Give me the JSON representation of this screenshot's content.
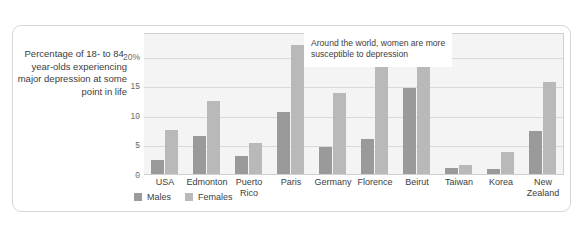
{
  "caption": "Percentage of 18- to 84-year-olds experiencing major depression at some point in life",
  "annotation": "Around the world, women are more susceptible to depression",
  "legend": {
    "males_label": "Males",
    "females_label": "Females"
  },
  "colors": {
    "males": "#9a9a9a",
    "females": "#b9b9b9",
    "plot_background": "#f4f4f4",
    "gridline": "#d9d9d9",
    "frame_border": "#d6d6d6"
  },
  "chart_data": {
    "type": "bar",
    "title": "",
    "xlabel": "",
    "ylabel": "Percentage of 18- to 84-year-olds experiencing major depression at some point in life",
    "ylim": [
      0,
      24
    ],
    "yticks": [
      0,
      5,
      10,
      15,
      20
    ],
    "ytick_labels": [
      "0",
      "5",
      "10",
      "15",
      "20%"
    ],
    "grid": true,
    "legend_position": "bottom-left",
    "annotations": [
      "Around the world, women are more susceptible to depression"
    ],
    "categories": [
      "USA",
      "Edmonton",
      "Puerto Rico",
      "Paris",
      "Germany",
      "Florence",
      "Beirut",
      "Taiwan",
      "Korea",
      "New Zealand"
    ],
    "series": [
      {
        "name": "Males",
        "values": [
          2.3,
          6.4,
          3.0,
          10.5,
          4.6,
          5.9,
          14.6,
          1.0,
          0.8,
          7.3
        ]
      },
      {
        "name": "Females",
        "values": [
          7.4,
          12.4,
          5.3,
          21.8,
          13.7,
          18.3,
          23.1,
          1.6,
          3.7,
          15.6
        ]
      }
    ]
  }
}
